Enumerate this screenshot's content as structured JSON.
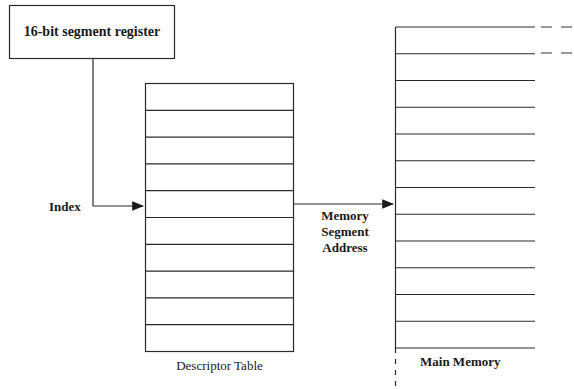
{
  "segment_register": {
    "label": "16-bit segment register"
  },
  "index_label": "Index",
  "descriptor_table": {
    "label": "Descriptor Table",
    "rows": 10
  },
  "arrow_label": {
    "line1": "Memory",
    "line2": "Segment",
    "line3": "Address"
  },
  "main_memory": {
    "label": "Main Memory",
    "rows": 12
  },
  "colors": {
    "stroke": "#2a2a2a",
    "background": "#ffffff"
  }
}
